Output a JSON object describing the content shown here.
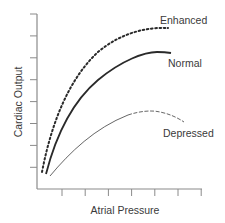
{
  "chart_data": {
    "type": "line",
    "title": "",
    "xlabel": "Atrial Pressure",
    "ylabel": "Cardiac Output",
    "x_ticks_count": 7,
    "y_ticks_count": 8,
    "tick_labels": false,
    "grid": false,
    "legend": "inline labels at curve ends",
    "xlim": [
      0,
      7
    ],
    "ylim": [
      0,
      8
    ],
    "series": [
      {
        "name": "Enhanced",
        "style": "dotted",
        "points": [
          [
            0.2,
            0.8
          ],
          [
            1.0,
            3.5
          ],
          [
            2.0,
            5.4
          ],
          [
            3.0,
            6.6
          ],
          [
            4.0,
            7.2
          ],
          [
            5.0,
            7.5
          ],
          [
            5.5,
            7.55
          ]
        ]
      },
      {
        "name": "Normal",
        "style": "solid-thick",
        "points": [
          [
            0.35,
            0.7
          ],
          [
            1.0,
            2.8
          ],
          [
            2.0,
            4.5
          ],
          [
            3.0,
            5.7
          ],
          [
            4.0,
            6.3
          ],
          [
            5.0,
            6.5
          ],
          [
            5.6,
            6.5
          ]
        ]
      },
      {
        "name": "Depressed",
        "style": "thin, dashed toward end",
        "points": [
          [
            0.55,
            0.6
          ],
          [
            1.5,
            1.7
          ],
          [
            2.5,
            2.5
          ],
          [
            3.5,
            3.1
          ],
          [
            4.5,
            3.4
          ],
          [
            5.2,
            3.35
          ],
          [
            6.0,
            3.0
          ]
        ]
      }
    ]
  },
  "labels": {
    "ylabel": "Cardiac Output",
    "xlabel": "Atrial Pressure",
    "enhanced": "Enhanced",
    "normal": "Normal",
    "depressed": "Depressed"
  },
  "colors": {
    "axis": "#8a8a8a",
    "curve": "#2a2a2a",
    "depressed": "#555555",
    "text": "#3a3a3a"
  }
}
